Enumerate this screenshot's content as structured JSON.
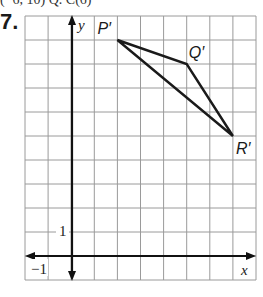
{
  "header": {
    "partial_text": "(−6, 10)  Q. C(6)"
  },
  "problem": {
    "number": "7."
  },
  "graph": {
    "x_axis_label": "x",
    "y_axis_label": "y",
    "tick_label_x_neg1": "−1",
    "tick_label_y_1": "1",
    "x_range": [
      -2,
      8
    ],
    "y_range": [
      -1,
      10
    ],
    "grid": true,
    "points": [
      {
        "label": "P′",
        "x": 2,
        "y": 9
      },
      {
        "label": "Q′",
        "x": 5,
        "y": 8
      },
      {
        "label": "R′",
        "x": 7,
        "y": 5
      }
    ]
  },
  "colors": {
    "grid": "#9a9a9a",
    "axis": "#111111",
    "figure": "#1a1a1a"
  }
}
